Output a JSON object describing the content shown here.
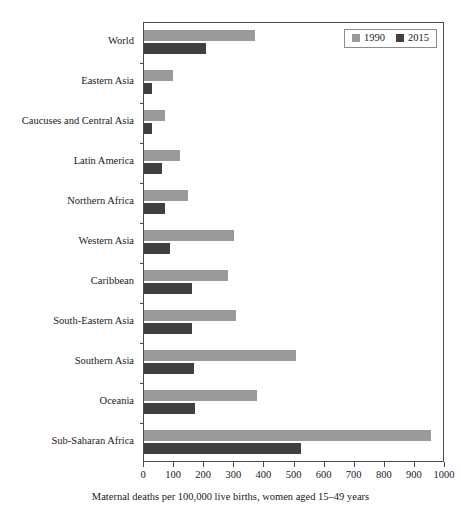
{
  "chart_data": {
    "type": "bar",
    "orientation": "horizontal",
    "title": "",
    "xlabel": "Maternal deaths per 100,000 live births, women aged 15–49 years",
    "ylabel": "",
    "xlim": [
      0,
      1000
    ],
    "xticks": [
      0,
      100,
      200,
      300,
      400,
      500,
      600,
      700,
      800,
      900,
      1000
    ],
    "grid": false,
    "legend_position": "top-right",
    "categories": [
      "World",
      "Eastern Asia",
      "Caucuses and Central Asia",
      "Latin America",
      "Northern Africa",
      "Western Asia",
      "Caribbean",
      "South-Eastern Asia",
      "Southern Asia",
      "Oceania",
      "Sub-Saharan Africa"
    ],
    "series": [
      {
        "name": "1990",
        "color": "#9a9a9a",
        "values": [
          370,
          95,
          70,
          120,
          145,
          300,
          280,
          305,
          505,
          375,
          955
        ]
      },
      {
        "name": "2015",
        "color": "#404040",
        "values": [
          205,
          27,
          25,
          60,
          70,
          85,
          160,
          160,
          165,
          170,
          520
        ]
      }
    ]
  },
  "legend": {
    "entries": [
      {
        "label": "1990",
        "color": "#9a9a9a"
      },
      {
        "label": "2015",
        "color": "#404040"
      }
    ]
  },
  "axis": {
    "x_title": "Maternal deaths per 100,000 live births, women aged 15–49 years",
    "x_tick_labels": [
      "0",
      "100",
      "200",
      "300",
      "400",
      "500",
      "600",
      "700",
      "800",
      "900",
      "1000"
    ]
  }
}
